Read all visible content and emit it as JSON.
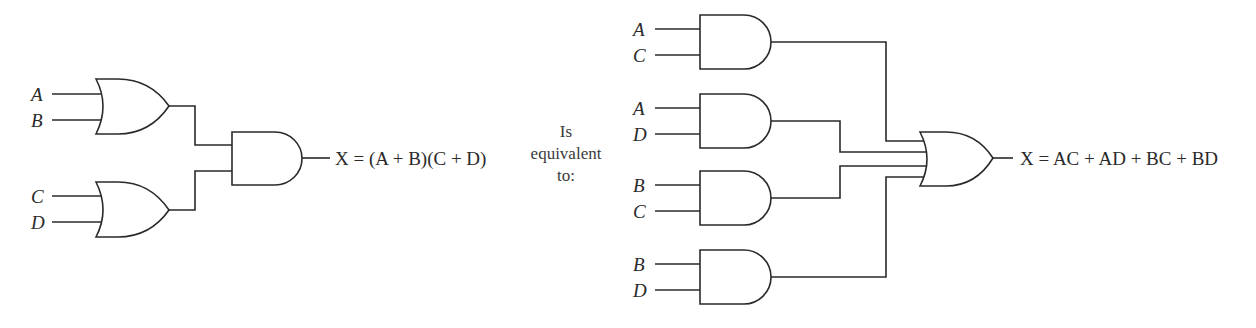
{
  "left_circuit": {
    "inputs": [
      "A",
      "B",
      "C",
      "D"
    ],
    "gates": [
      {
        "type": "OR",
        "inputs": [
          "A",
          "B"
        ]
      },
      {
        "type": "OR",
        "inputs": [
          "C",
          "D"
        ]
      },
      {
        "type": "AND",
        "inputs": [
          "A+B",
          "C+D"
        ]
      }
    ],
    "output_expression": "X = (A + B)(C + D)"
  },
  "middle_text": {
    "line1": "Is",
    "line2": "equivalent",
    "line3": "to:"
  },
  "right_circuit": {
    "inputs": [
      "A",
      "C",
      "A",
      "D",
      "B",
      "C",
      "B",
      "D"
    ],
    "gates": [
      {
        "type": "AND",
        "inputs": [
          "A",
          "C"
        ]
      },
      {
        "type": "AND",
        "inputs": [
          "A",
          "D"
        ]
      },
      {
        "type": "AND",
        "inputs": [
          "B",
          "C"
        ]
      },
      {
        "type": "AND",
        "inputs": [
          "B",
          "D"
        ]
      },
      {
        "type": "OR",
        "inputs": [
          "AC",
          "AD",
          "BC",
          "BD"
        ]
      }
    ],
    "output_expression": "X = AC + AD + BC + BD"
  },
  "colors": {
    "stroke": "#2a2a2a",
    "background": "#ffffff"
  }
}
